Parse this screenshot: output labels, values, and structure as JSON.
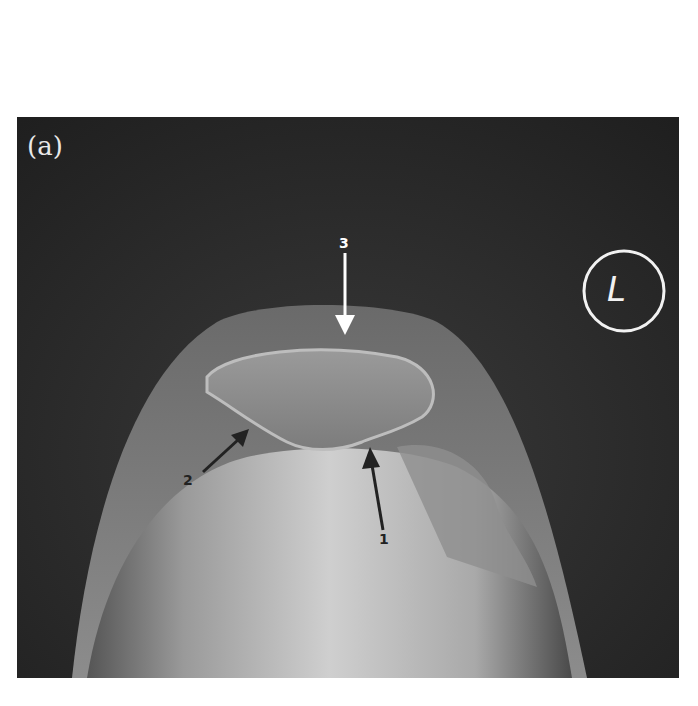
{
  "figure": {
    "panel_label": "(a)",
    "side_marker": "L",
    "arrows": [
      {
        "label": "1",
        "color": "#222222"
      },
      {
        "label": "2",
        "color": "#222222"
      },
      {
        "label": "3",
        "color": "#ffffff"
      }
    ]
  }
}
